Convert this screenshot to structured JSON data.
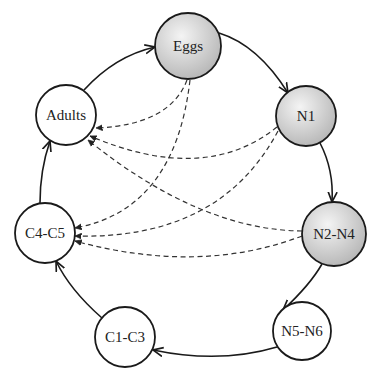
{
  "diagram": {
    "type": "life-cycle",
    "nodes": [
      {
        "id": "eggs",
        "label": "Eggs",
        "shaded": true
      },
      {
        "id": "n1",
        "label": "N1",
        "shaded": true
      },
      {
        "id": "n2n4",
        "label": "N2-N4",
        "shaded": true
      },
      {
        "id": "n5n6",
        "label": "N5-N6",
        "shaded": false
      },
      {
        "id": "c1c3",
        "label": "C1-C3",
        "shaded": false
      },
      {
        "id": "c4c5",
        "label": "C4-C5",
        "shaded": false
      },
      {
        "id": "adults",
        "label": "Adults",
        "shaded": false
      }
    ],
    "solid_edges": [
      {
        "from": "Eggs",
        "to": "N1"
      },
      {
        "from": "N1",
        "to": "N2-N4"
      },
      {
        "from": "N2-N4",
        "to": "N5-N6"
      },
      {
        "from": "N5-N6",
        "to": "C1-C3"
      },
      {
        "from": "C1-C3",
        "to": "C4-C5"
      },
      {
        "from": "C4-C5",
        "to": "Adults"
      },
      {
        "from": "Adults",
        "to": "Eggs"
      }
    ],
    "dashed_edges": [
      {
        "from": "Eggs",
        "to": "Adults"
      },
      {
        "from": "Eggs",
        "to": "C4-C5"
      },
      {
        "from": "N1",
        "to": "Adults"
      },
      {
        "from": "N1",
        "to": "C4-C5"
      },
      {
        "from": "N2-N4",
        "to": "Adults"
      },
      {
        "from": "N2-N4",
        "to": "C4-C5"
      }
    ],
    "colors": {
      "shaded_fill_light": "#f2f2f2",
      "shaded_fill_dark": "#b8b8b8",
      "unshaded_fill": "#ffffff",
      "stroke": "#1a1a1a"
    }
  }
}
